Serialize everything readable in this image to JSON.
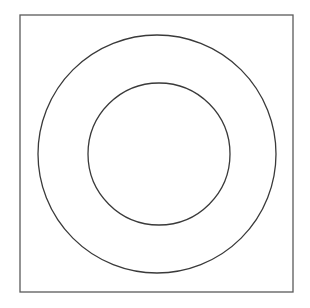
{
  "figure": {
    "background_color": "#ffffff",
    "canvas": {
      "width": 310,
      "height": 308
    }
  },
  "chart_data": {
    "type": "diagram",
    "title": "",
    "subtitle": "",
    "xlabel": "",
    "ylabel": "",
    "grid": false,
    "legend": null,
    "annotations": [],
    "shapes": [
      {
        "name": "square-frame",
        "kind": "rect",
        "x": 20,
        "y": 15,
        "width": 273,
        "height": 277,
        "stroke": "#5a5a5a",
        "stroke_width": 1.3,
        "fill": "none"
      },
      {
        "name": "outer-circle",
        "kind": "circle",
        "cx": 157,
        "cy": 154,
        "r": 119,
        "stroke": "#3a3a3a",
        "stroke_width": 1.3,
        "fill": "none"
      },
      {
        "name": "inner-circle",
        "kind": "circle",
        "cx": 159,
        "cy": 154,
        "r": 71,
        "stroke": "#3a3a3a",
        "stroke_width": 1.3,
        "fill": "none"
      }
    ]
  }
}
